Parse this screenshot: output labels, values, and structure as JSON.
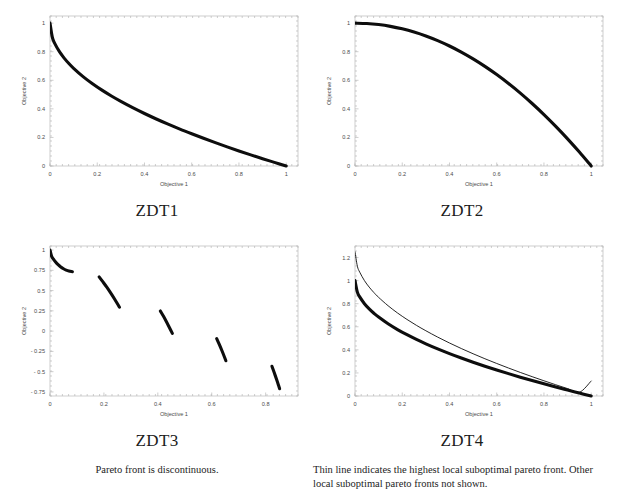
{
  "page": {
    "background": "#ffffff",
    "text_color": "#1c1c1c",
    "curve_color": "#0d0d0d",
    "axis_color": "#b9b9b9"
  },
  "panels": [
    {
      "id": "zdt1",
      "title": "ZDT1",
      "caption": "",
      "chart_index": 0
    },
    {
      "id": "zdt2",
      "title": "ZDT2",
      "caption": "",
      "chart_index": 1
    },
    {
      "id": "zdt3",
      "title": "ZDT3",
      "caption": "Pareto front is discontinuous.",
      "chart_index": 2
    },
    {
      "id": "zdt4",
      "title": "ZDT4",
      "caption": "Thin line indicates the highest local suboptimal pareto front. Other local suboptimal pareto fronts not shown.",
      "chart_index": 3
    }
  ],
  "chart_data": [
    {
      "type": "line",
      "title": "ZDT1",
      "xlabel": "Objective 1",
      "ylabel": "Objective 2",
      "xlim": [
        0,
        1.05
      ],
      "ylim": [
        0,
        1.05
      ],
      "xticks": [
        0,
        0.2,
        0.4,
        0.6,
        0.8,
        1
      ],
      "xticklabels": [
        "0",
        "0.2",
        "0.4",
        "0.6",
        "0.8",
        "1"
      ],
      "yticks": [
        0,
        0.2,
        0.4,
        0.6,
        0.8,
        1
      ],
      "yticklabels": [
        "0",
        "0.2",
        "0.4",
        "0.6",
        "0.8",
        "1"
      ],
      "grid": false,
      "legend": null,
      "series": [
        {
          "name": "pareto-front",
          "style": "thick",
          "x": [
            0,
            0.01,
            0.02,
            0.04,
            0.06,
            0.08,
            0.1,
            0.14,
            0.18,
            0.22,
            0.26,
            0.3,
            0.35,
            0.4,
            0.45,
            0.5,
            0.55,
            0.6,
            0.65,
            0.7,
            0.75,
            0.8,
            0.85,
            0.9,
            0.95,
            1
          ],
          "y": [
            1,
            0.9,
            0.8586,
            0.8,
            0.7551,
            0.7172,
            0.6838,
            0.6259,
            0.5757,
            0.5309,
            0.49,
            0.4523,
            0.4084,
            0.3675,
            0.3292,
            0.2929,
            0.2583,
            0.2254,
            0.1938,
            0.1633,
            0.134,
            0.1056,
            0.078,
            0.0513,
            0.0253,
            0
          ]
        }
      ]
    },
    {
      "type": "line",
      "title": "ZDT2",
      "xlabel": "Objective 1",
      "ylabel": "Objective 2",
      "xlim": [
        0,
        1.05
      ],
      "ylim": [
        0,
        1.05
      ],
      "xticks": [
        0,
        0.2,
        0.4,
        0.6,
        0.8,
        1
      ],
      "xticklabels": [
        "0",
        "0.2",
        "0.4",
        "0.6",
        "0.8",
        "1"
      ],
      "yticks": [
        0,
        0.2,
        0.4,
        0.6,
        0.8,
        1
      ],
      "yticklabels": [
        "0",
        "0.2",
        "0.4",
        "0.6",
        "0.8",
        "1"
      ],
      "grid": false,
      "legend": null,
      "series": [
        {
          "name": "pareto-front",
          "style": "thick",
          "x": [
            0,
            0.05,
            0.1,
            0.15,
            0.2,
            0.25,
            0.3,
            0.35,
            0.4,
            0.45,
            0.5,
            0.55,
            0.6,
            0.65,
            0.7,
            0.75,
            0.8,
            0.85,
            0.9,
            0.95,
            1
          ],
          "y": [
            1,
            0.9975,
            0.99,
            0.9775,
            0.96,
            0.9375,
            0.91,
            0.8775,
            0.84,
            0.7975,
            0.75,
            0.6975,
            0.64,
            0.5775,
            0.51,
            0.4375,
            0.36,
            0.2775,
            0.19,
            0.0975,
            0
          ]
        }
      ]
    },
    {
      "type": "line",
      "title": "ZDT3",
      "xlabel": "Objective 1",
      "ylabel": "Objective 2",
      "xlim": [
        0,
        0.92
      ],
      "ylim": [
        -0.8,
        1.05
      ],
      "xticks": [
        0,
        0.2,
        0.4,
        0.6,
        0.8
      ],
      "xticklabels": [
        "0",
        "0.2",
        "0.4",
        "0.6",
        "0.8"
      ],
      "yticks": [
        -0.75,
        -0.5,
        -0.25,
        0,
        0.25,
        0.5,
        0.75,
        1
      ],
      "yticklabels": [
        "- 0.75",
        "- 0.5",
        "- 0.25",
        "0",
        "0.25",
        "0.5",
        "0.75",
        "1"
      ],
      "grid": false,
      "legend": null,
      "discontinuous": true,
      "segments": [
        {
          "name": "segment-1",
          "x_range": [
            0,
            0.083
          ],
          "x": [
            0,
            0.006,
            0.012,
            0.02,
            0.03,
            0.04,
            0.05,
            0.06,
            0.07,
            0.083
          ],
          "y": [
            1,
            0.923,
            0.8905,
            0.8553,
            0.8194,
            0.7915,
            0.7697,
            0.7531,
            0.7413,
            0.7325
          ]
        },
        {
          "name": "segment-2",
          "x_range": [
            0.1822,
            0.2578
          ],
          "x": [
            0.1822,
            0.195,
            0.21,
            0.225,
            0.24,
            0.2578
          ],
          "y": [
            0.6692,
            0.6131,
            0.5452,
            0.4718,
            0.3931,
            0.2949
          ]
        },
        {
          "name": "segment-3",
          "x_range": [
            0.4093,
            0.4539
          ],
          "x": [
            0.4093,
            0.42,
            0.43,
            0.44,
            0.4539
          ],
          "y": [
            0.2488,
            0.1889,
            0.1282,
            0.0639,
            -0.0283
          ]
        },
        {
          "name": "segment-4",
          "x_range": [
            0.6183,
            0.6525
          ],
          "x": [
            0.6183,
            0.628,
            0.638,
            0.646,
            0.6525
          ],
          "y": [
            -0.0916,
            -0.163,
            -0.2419,
            -0.3091,
            -0.3654
          ]
        },
        {
          "name": "segment-5",
          "x_range": [
            0.8233,
            0.8518
          ],
          "x": [
            0.8233,
            0.832,
            0.841,
            0.847,
            0.8518
          ],
          "y": [
            -0.4332,
            -0.5134,
            -0.6005,
            -0.6605,
            -0.7096
          ]
        }
      ]
    },
    {
      "type": "line",
      "title": "ZDT4",
      "xlabel": "Objective 1",
      "ylabel": "Objective 2",
      "xlim": [
        0,
        1.05
      ],
      "ylim": [
        0,
        1.3
      ],
      "xticks": [
        0,
        0.2,
        0.4,
        0.6,
        0.8,
        1
      ],
      "xticklabels": [
        "0",
        "0.2",
        "0.4",
        "0.6",
        "0.8",
        "1"
      ],
      "yticks": [
        0,
        0.2,
        0.4,
        0.6,
        0.8,
        1,
        1.2
      ],
      "yticklabels": [
        "0",
        "0.2",
        "0.4",
        "0.6",
        "0.8",
        "1",
        "1.2"
      ],
      "grid": false,
      "legend": null,
      "series": [
        {
          "name": "global-pareto-front",
          "style": "thick",
          "x": [
            0,
            0.01,
            0.02,
            0.04,
            0.06,
            0.08,
            0.1,
            0.14,
            0.18,
            0.22,
            0.26,
            0.3,
            0.35,
            0.4,
            0.45,
            0.5,
            0.55,
            0.6,
            0.65,
            0.7,
            0.75,
            0.8,
            0.85,
            0.9,
            0.95,
            1
          ],
          "y": [
            1,
            0.9,
            0.8586,
            0.8,
            0.7551,
            0.7172,
            0.6838,
            0.6259,
            0.5757,
            0.5309,
            0.49,
            0.4523,
            0.4084,
            0.3675,
            0.3292,
            0.2929,
            0.2583,
            0.2254,
            0.1938,
            0.1633,
            0.134,
            0.1056,
            0.078,
            0.0513,
            0.0253,
            0
          ]
        },
        {
          "name": "highest-local-suboptimal-front",
          "style": "thin",
          "x": [
            0,
            0.01,
            0.02,
            0.04,
            0.06,
            0.08,
            0.1,
            0.14,
            0.18,
            0.22,
            0.26,
            0.3,
            0.35,
            0.4,
            0.45,
            0.5,
            0.55,
            0.6,
            0.65,
            0.7,
            0.75,
            0.8,
            0.85,
            0.9,
            0.95,
            1
          ],
          "y": [
            1.25,
            1.125,
            1.0733,
            1.0,
            0.9439,
            0.8965,
            0.8548,
            0.7824,
            0.7196,
            0.6636,
            0.6125,
            0.5654,
            0.5105,
            0.4594,
            0.4115,
            0.3661,
            0.3229,
            0.2818,
            0.2423,
            0.2041,
            0.1675,
            0.132,
            0.0975,
            0.0641,
            0.0316,
            0.13
          ]
        }
      ]
    }
  ]
}
